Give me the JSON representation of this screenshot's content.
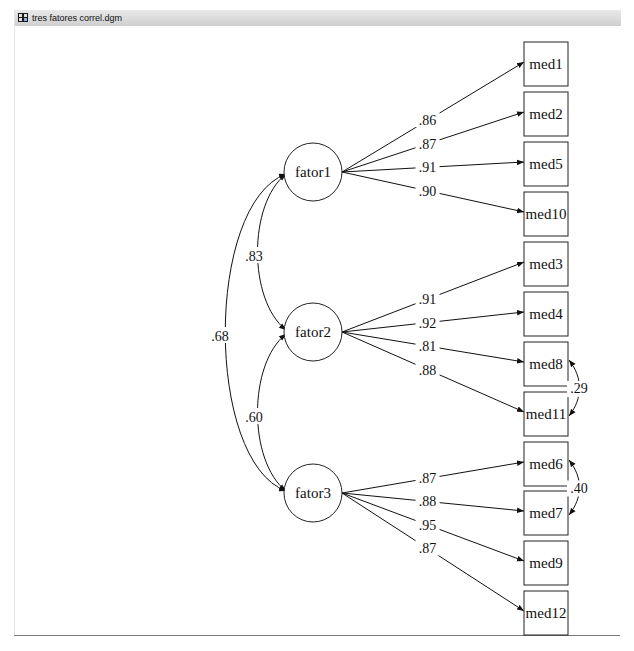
{
  "window": {
    "title": "tres fatores correl.dgm",
    "icon": "diagram-file-icon"
  },
  "diagram": {
    "type": "structural-equation-model",
    "factors": [
      {
        "id": "fator1",
        "label": "fator1",
        "cx": 313,
        "cy": 172
      },
      {
        "id": "fator2",
        "label": "fator2",
        "cx": 313,
        "cy": 332
      },
      {
        "id": "fator3",
        "label": "fator3",
        "cx": 313,
        "cy": 493
      }
    ],
    "indicators": [
      {
        "id": "med1",
        "label": "med1",
        "y": 42
      },
      {
        "id": "med2",
        "label": "med2",
        "y": 92
      },
      {
        "id": "med5",
        "label": "med5",
        "y": 142
      },
      {
        "id": "med10",
        "label": "med10",
        "y": 192
      },
      {
        "id": "med3",
        "label": "med3",
        "y": 242
      },
      {
        "id": "med4",
        "label": "med4",
        "y": 292
      },
      {
        "id": "med8",
        "label": "med8",
        "y": 342
      },
      {
        "id": "med11",
        "label": "med11",
        "y": 392
      },
      {
        "id": "med6",
        "label": "med6",
        "y": 442
      },
      {
        "id": "med7",
        "label": "med7",
        "y": 491
      },
      {
        "id": "med9",
        "label": "med9",
        "y": 541
      },
      {
        "id": "med12",
        "label": "med12",
        "y": 591
      }
    ],
    "loadings": [
      {
        "from": "fator1",
        "to": "med1",
        "value": ".86"
      },
      {
        "from": "fator1",
        "to": "med2",
        "value": ".87"
      },
      {
        "from": "fator1",
        "to": "med5",
        "value": ".91"
      },
      {
        "from": "fator1",
        "to": "med10",
        "value": ".90"
      },
      {
        "from": "fator2",
        "to": "med3",
        "value": ".91"
      },
      {
        "from": "fator2",
        "to": "med4",
        "value": ".92"
      },
      {
        "from": "fator2",
        "to": "med8",
        "value": ".81"
      },
      {
        "from": "fator2",
        "to": "med11",
        "value": ".88"
      },
      {
        "from": "fator3",
        "to": "med6",
        "value": ".87"
      },
      {
        "from": "fator3",
        "to": "med7",
        "value": ".88"
      },
      {
        "from": "fator3",
        "to": "med9",
        "value": ".95"
      },
      {
        "from": "fator3",
        "to": "med12",
        "value": ".87"
      }
    ],
    "factor_correlations": [
      {
        "between": [
          "fator1",
          "fator2"
        ],
        "value": ".83"
      },
      {
        "between": [
          "fator1",
          "fator3"
        ],
        "value": ".68"
      },
      {
        "between": [
          "fator2",
          "fator3"
        ],
        "value": ".60"
      }
    ],
    "error_correlations": [
      {
        "between": [
          "med8",
          "med11"
        ],
        "value": ".29"
      },
      {
        "between": [
          "med6",
          "med7"
        ],
        "value": ".40"
      }
    ]
  }
}
